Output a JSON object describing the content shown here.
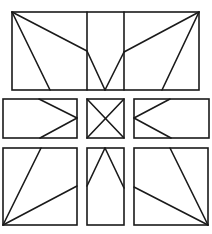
{
  "diagram": {
    "stroke_color": "#1a1a1a",
    "background": "#ffffff",
    "panels": [
      {
        "name": "top-panel",
        "rect": [
          12,
          12,
          187,
          78
        ],
        "lines": [
          [
            12,
            12,
            50,
            90
          ],
          [
            12,
            12,
            87,
            51
          ],
          [
            87,
            51,
            105,
            90
          ],
          [
            199,
            12,
            162,
            90
          ],
          [
            199,
            12,
            124,
            52
          ],
          [
            124,
            52,
            105,
            90
          ],
          [
            87,
            12,
            87,
            90
          ],
          [
            124,
            12,
            124,
            90
          ]
        ]
      },
      {
        "name": "middle-left-panel",
        "rect": [
          3,
          99,
          74,
          39
        ],
        "lines": [
          [
            39,
            99,
            77,
            118
          ],
          [
            77,
            118,
            40,
            138
          ]
        ]
      },
      {
        "name": "middle-center-panel",
        "rect": [
          87,
          99,
          37,
          39
        ],
        "lines": [
          [
            87,
            99,
            124,
            138
          ],
          [
            124,
            99,
            87,
            138
          ]
        ]
      },
      {
        "name": "middle-right-panel",
        "rect": [
          134,
          99,
          75,
          39
        ],
        "lines": [
          [
            170,
            99,
            134,
            118
          ],
          [
            134,
            118,
            171,
            138
          ]
        ]
      },
      {
        "name": "bottom-left-panel",
        "rect": [
          3,
          148,
          74,
          77
        ],
        "lines": [
          [
            3,
            225,
            41,
            148
          ],
          [
            3,
            225,
            77,
            186
          ]
        ]
      },
      {
        "name": "bottom-center-panel",
        "rect": [
          87,
          148,
          37,
          77
        ],
        "lines": [
          [
            87,
            186,
            105,
            148
          ],
          [
            105,
            148,
            124,
            188
          ]
        ]
      },
      {
        "name": "bottom-right-panel",
        "rect": [
          134,
          148,
          74,
          77
        ],
        "lines": [
          [
            208,
            225,
            170,
            148
          ],
          [
            208,
            225,
            134,
            187
          ]
        ]
      }
    ]
  }
}
